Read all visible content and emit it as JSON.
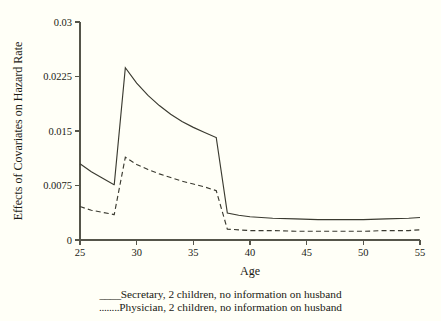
{
  "chart_data": {
    "type": "line",
    "title": "",
    "xlabel": "Age",
    "ylabel": "Effects of Covariates on Hazard Rate",
    "xlim": [
      25,
      55
    ],
    "ylim": [
      0,
      0.03
    ],
    "xticks": [
      25,
      30,
      35,
      40,
      45,
      50,
      55
    ],
    "xtick_labels": [
      "25",
      "30",
      "35",
      "40",
      "45",
      "50",
      "55"
    ],
    "yticks": [
      0,
      0.0075,
      0.015,
      0.0225,
      0.03
    ],
    "ytick_labels": [
      "0",
      "0.0075",
      "0.015",
      "0.0225",
      "0.03"
    ],
    "grid": false,
    "legend_position": "below",
    "series": [
      {
        "name": "Secretary, 2 children, no information on husband",
        "style": "solid",
        "legend_key": "____",
        "x": [
          25,
          26,
          27,
          28,
          28.02,
          29,
          30,
          31,
          32,
          33,
          34,
          35,
          36,
          37,
          37.02,
          38,
          39,
          40,
          42,
          44,
          46,
          48,
          50,
          52,
          54,
          55
        ],
        "y": [
          0.0105,
          0.0094,
          0.0085,
          0.0076,
          0.0076,
          0.0237,
          0.0216,
          0.0199,
          0.0185,
          0.0173,
          0.0163,
          0.0155,
          0.0148,
          0.0141,
          0.0141,
          0.0037,
          0.0034,
          0.0032,
          0.003,
          0.0029,
          0.0028,
          0.0028,
          0.0028,
          0.0029,
          0.003,
          0.0031
        ]
      },
      {
        "name": "Physician, 2 children, no information on husband",
        "style": "dashed",
        "legend_key": "........",
        "x": [
          25,
          26,
          27,
          28,
          28.02,
          29,
          30,
          31,
          32,
          33,
          34,
          35,
          36,
          37,
          37.02,
          38,
          39,
          40,
          42,
          44,
          46,
          48,
          50,
          52,
          54,
          55
        ],
        "y": [
          0.0046,
          0.0041,
          0.0038,
          0.0035,
          0.0035,
          0.0114,
          0.0104,
          0.0097,
          0.0091,
          0.0086,
          0.0081,
          0.0077,
          0.0073,
          0.0068,
          0.0068,
          0.0015,
          0.0014,
          0.0013,
          0.0013,
          0.0012,
          0.0012,
          0.0012,
          0.0012,
          0.0013,
          0.0013,
          0.0014
        ]
      }
    ]
  },
  "legend": {
    "entries": [
      {
        "key": "____",
        "label": "Secretary, 2 children, no information on husband"
      },
      {
        "key": "........",
        "label": "Physician, 2 children, no information on husband"
      }
    ]
  },
  "axes": {
    "x_title": "Age",
    "y_title": "Effects of Covariates on Hazard Rate"
  },
  "colors": {
    "background": "#fffff7",
    "axis": "#55554a",
    "line": "#3a3a30",
    "text": "#1a1a14"
  }
}
